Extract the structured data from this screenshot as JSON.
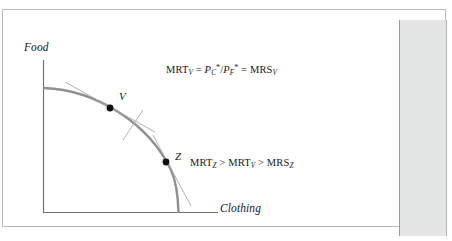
{
  "figure": {
    "type": "economics-diagram",
    "name": "production-possibility-frontier",
    "axes": {
      "y_label": "Food",
      "x_label": "Clothing"
    },
    "points": [
      {
        "id": "V",
        "label": "V",
        "x": 107,
        "y": 98
      },
      {
        "id": "Z",
        "label": "Z",
        "x": 163,
        "y": 152
      }
    ],
    "equations": {
      "top": {
        "lhs": "MRT",
        "lhs_sub": "V",
        "eq1": " = ",
        "num": "P",
        "num_sub": "C",
        "num_sup": "*",
        "slash": "/",
        "den": "P",
        "den_sub": "F",
        "den_sup": "*",
        "eq2": " = ",
        "rhs": "MRS",
        "rhs_sub": "V",
        "plain": "MRTV = PC*/PF* = MRSV"
      },
      "bottom": {
        "t1": "MRT",
        "t1_sub": "Z",
        "gt1": " > ",
        "t2": "MRT",
        "t2_sub": "V",
        "gt2": " > ",
        "t3": "MRS",
        "t3_sub": "Z",
        "plain": "MRTZ > MRTV > MRSZ"
      }
    },
    "colors": {
      "curve": "#909090",
      "axis": "#6e6e6e",
      "tangent": "#a8a8a8",
      "point": "#101010",
      "text": "#17181a",
      "panel": "#e4e6e6",
      "frame": "#b9b9b9"
    }
  }
}
